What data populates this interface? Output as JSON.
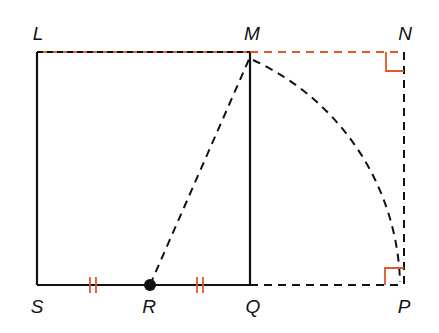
{
  "diagram": {
    "type": "geometry",
    "colors": {
      "line": "#111111",
      "accent": "#e0572e"
    },
    "points": {
      "L": {
        "label": "L",
        "x": 37,
        "y": 52
      },
      "M": {
        "label": "M",
        "x": 250,
        "y": 52
      },
      "N": {
        "label": "N",
        "x": 404,
        "y": 52
      },
      "S": {
        "label": "S",
        "x": 37,
        "y": 285
      },
      "R": {
        "label": "R",
        "x": 150,
        "y": 285
      },
      "Q": {
        "label": "Q",
        "x": 250,
        "y": 285
      },
      "P": {
        "label": "P",
        "x": 404,
        "y": 285
      }
    },
    "labels": [
      {
        "id": "L",
        "text": "L",
        "x": 38,
        "y": 33
      },
      {
        "id": "M",
        "text": "M",
        "x": 252,
        "y": 33
      },
      {
        "id": "N",
        "text": "N",
        "x": 405,
        "y": 33
      },
      {
        "id": "S",
        "text": "S",
        "x": 37,
        "y": 306
      },
      {
        "id": "R",
        "text": "R",
        "x": 149,
        "y": 306
      },
      {
        "id": "Q",
        "text": "Q",
        "x": 253,
        "y": 306
      },
      {
        "id": "P",
        "text": "P",
        "x": 404,
        "y": 306
      }
    ],
    "markings": {
      "congruent_ticks": [
        "SR",
        "RQ"
      ],
      "right_angles": [
        "N",
        "P"
      ]
    }
  }
}
